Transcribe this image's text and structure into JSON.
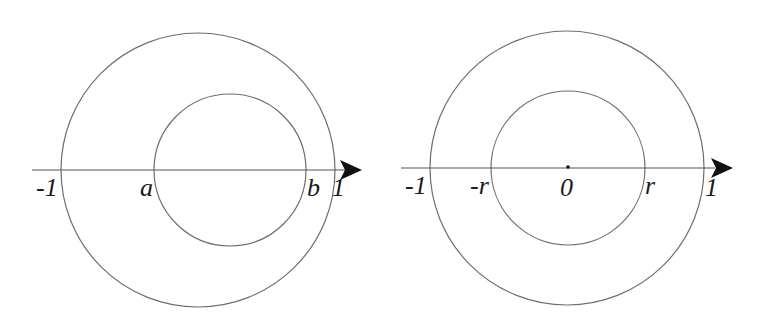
{
  "diagrams": [
    {
      "name": "left",
      "labels": {
        "neg_one": "-1",
        "a": "a",
        "b": "b",
        "one": "1"
      }
    },
    {
      "name": "right",
      "labels": {
        "neg_one": "-1",
        "neg_r": "-r",
        "zero": "0",
        "r": "r",
        "one": "1"
      }
    }
  ],
  "colors": {
    "line": "#6e6e6e",
    "text": "#1a1a1a",
    "arrow": "#111111"
  }
}
